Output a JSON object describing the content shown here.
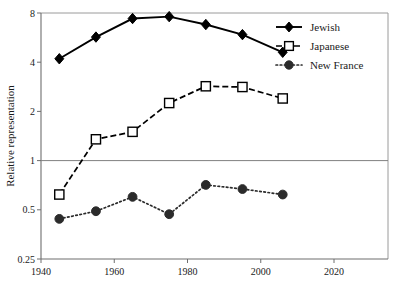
{
  "chart_data": {
    "type": "line",
    "title": "",
    "xlabel": "",
    "ylabel": "Relative representation",
    "yscale": "log2",
    "ylim": [
      0.25,
      8
    ],
    "xlim": [
      1940,
      2030
    ],
    "xticks": [
      1940,
      1960,
      1980,
      2000,
      2020
    ],
    "xtick_labels": [
      "1940",
      "1960",
      "1980",
      "2000",
      "2020"
    ],
    "yticks": [
      0.25,
      0.5,
      1,
      2,
      4,
      8
    ],
    "ytick_labels": [
      "0.25",
      "0.5",
      "1",
      "2",
      "4",
      "8"
    ],
    "grid": false,
    "reference_line": {
      "y": 1,
      "color": "#808080"
    },
    "legend_position": "top-right",
    "x": [
      1945,
      1955,
      1965,
      1975,
      1985,
      1995,
      2006
    ],
    "series": [
      {
        "name": "Jewish",
        "marker": "filled-diamond",
        "linestyle": "solid",
        "color": "#000000",
        "values": [
          4.2,
          5.7,
          7.4,
          7.6,
          6.8,
          5.9,
          4.6
        ]
      },
      {
        "name": "Japanese",
        "marker": "open-square",
        "linestyle": "dashed",
        "color": "#000000",
        "values": [
          0.62,
          1.35,
          1.5,
          2.25,
          2.85,
          2.82,
          2.4
        ]
      },
      {
        "name": "New France",
        "marker": "filled-circle",
        "linestyle": "dotted",
        "color": "#2b2b2b",
        "values": [
          0.44,
          0.49,
          0.6,
          0.47,
          0.71,
          0.67,
          0.62
        ]
      }
    ]
  },
  "legend": {
    "items": [
      {
        "label": "Jewish"
      },
      {
        "label": "Japanese"
      },
      {
        "label": "New France"
      }
    ]
  },
  "axes": {
    "y_title": "Relative representation"
  }
}
